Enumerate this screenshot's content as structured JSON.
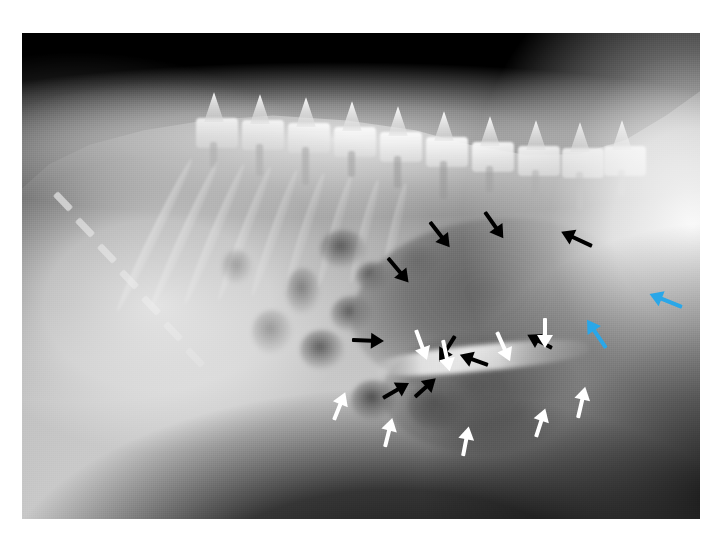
{
  "image": {
    "kind": "radiograph",
    "modality": "X-ray",
    "view": "lateral abdominal radiograph",
    "orientation": "cranial-left, caudal-right; dorsal-up",
    "background_color": "#ffffff",
    "plate_color": "#000000",
    "plate": {
      "x": 22,
      "y": 33,
      "width": 678,
      "height": 486
    },
    "canvas": {
      "width": 728,
      "height": 544
    }
  },
  "annotation_legend": {
    "black_arrows": "margins of the markedly gas-distended viscus",
    "white_arrows": "ventral / caudal serosal border",
    "blue_arrows": "caudal abdominal focal region of interest"
  },
  "colors": {
    "black_arrow": "#000000",
    "white_arrow": "#ffffff",
    "blue_arrow": "#2aa7e8"
  },
  "anatomy": [
    {
      "name": "thoracic-spine",
      "label": "vertebral column"
    },
    {
      "name": "ribs",
      "label": "rib cage"
    },
    {
      "name": "liver",
      "label": "liver"
    },
    {
      "name": "lung-field",
      "label": "caudal lung field"
    },
    {
      "name": "distended-viscus",
      "label": "gas-distended viscus"
    },
    {
      "name": "bowel-loops",
      "label": "small intestinal gas loops"
    },
    {
      "name": "pelvis",
      "label": "sacrum / pelvis"
    }
  ],
  "arrows": [
    {
      "id": "k1",
      "color": "black",
      "x": 430,
      "y": 222,
      "len": 30,
      "angle": 52
    },
    {
      "id": "k2",
      "color": "black",
      "x": 485,
      "y": 212,
      "len": 30,
      "angle": 55
    },
    {
      "id": "k3",
      "color": "black",
      "x": 388,
      "y": 258,
      "len": 30,
      "angle": 50
    },
    {
      "id": "k4",
      "color": "black",
      "x": 592,
      "y": 246,
      "len": 32,
      "angle": 205
    },
    {
      "id": "k5",
      "color": "black",
      "x": 352,
      "y": 340,
      "len": 30,
      "angle": 2
    },
    {
      "id": "k6",
      "color": "black",
      "x": 455,
      "y": 336,
      "len": 28,
      "angle": 122
    },
    {
      "id": "k7",
      "color": "black",
      "x": 488,
      "y": 365,
      "len": 28,
      "angle": 200
    },
    {
      "id": "k8",
      "color": "black",
      "x": 552,
      "y": 348,
      "len": 26,
      "angle": 208
    },
    {
      "id": "k9",
      "color": "black",
      "x": 383,
      "y": 398,
      "len": 28,
      "angle": 330
    },
    {
      "id": "k10",
      "color": "black",
      "x": 415,
      "y": 397,
      "len": 26,
      "angle": 318
    },
    {
      "id": "w1",
      "color": "white",
      "x": 416,
      "y": 330,
      "len": 30,
      "angle": 70
    },
    {
      "id": "w2",
      "color": "white",
      "x": 443,
      "y": 340,
      "len": 30,
      "angle": 78
    },
    {
      "id": "w3",
      "color": "white",
      "x": 497,
      "y": 332,
      "len": 30,
      "angle": 66
    },
    {
      "id": "w4",
      "color": "white",
      "x": 545,
      "y": 318,
      "len": 28,
      "angle": 90
    },
    {
      "id": "w5",
      "color": "white",
      "x": 334,
      "y": 420,
      "len": 28,
      "angle": 292
    },
    {
      "id": "w6",
      "color": "white",
      "x": 385,
      "y": 447,
      "len": 28,
      "angle": 284
    },
    {
      "id": "w7",
      "color": "white",
      "x": 463,
      "y": 456,
      "len": 28,
      "angle": 281
    },
    {
      "id": "w8",
      "color": "white",
      "x": 536,
      "y": 437,
      "len": 28,
      "angle": 288
    },
    {
      "id": "w9",
      "color": "white",
      "x": 578,
      "y": 418,
      "len": 30,
      "angle": 283
    },
    {
      "id": "b1",
      "color": "blue",
      "x": 682,
      "y": 307,
      "len": 33,
      "angle": 202
    },
    {
      "id": "b2",
      "color": "blue",
      "x": 606,
      "y": 348,
      "len": 32,
      "angle": 236
    }
  ],
  "bowel_loops": [
    {
      "x": 320,
      "y": 230,
      "w": 46,
      "h": 38,
      "tone": "rgba(70,70,70,.8)"
    },
    {
      "x": 356,
      "y": 262,
      "w": 34,
      "h": 30,
      "tone": "rgba(62,62,62,.85)"
    },
    {
      "x": 331,
      "y": 296,
      "w": 42,
      "h": 36,
      "tone": "rgba(66,66,66,.8)"
    },
    {
      "x": 400,
      "y": 246,
      "w": 40,
      "h": 34,
      "tone": "rgba(60,60,60,.8)"
    },
    {
      "x": 286,
      "y": 268,
      "w": 34,
      "h": 46,
      "tone": "rgba(80,80,80,.6)"
    },
    {
      "x": 300,
      "y": 330,
      "w": 44,
      "h": 40,
      "tone": "rgba(58,58,58,.75)"
    },
    {
      "x": 351,
      "y": 380,
      "w": 46,
      "h": 40,
      "tone": "rgba(52,52,52,.8)"
    },
    {
      "x": 408,
      "y": 382,
      "w": 58,
      "h": 48,
      "tone": "rgba(48,48,48,.85)"
    },
    {
      "x": 252,
      "y": 310,
      "w": 40,
      "h": 44,
      "tone": "rgba(92,92,92,.5)"
    },
    {
      "x": 222,
      "y": 250,
      "w": 30,
      "h": 34,
      "tone": "rgba(96,96,96,.45)"
    }
  ],
  "vertebrae": [
    {
      "x": 196,
      "y": 118
    },
    {
      "x": 242,
      "y": 120
    },
    {
      "x": 288,
      "y": 123
    },
    {
      "x": 334,
      "y": 127
    },
    {
      "x": 380,
      "y": 132
    },
    {
      "x": 426,
      "y": 137
    },
    {
      "x": 472,
      "y": 142
    },
    {
      "x": 518,
      "y": 146
    },
    {
      "x": 562,
      "y": 148
    },
    {
      "x": 604,
      "y": 146
    }
  ]
}
